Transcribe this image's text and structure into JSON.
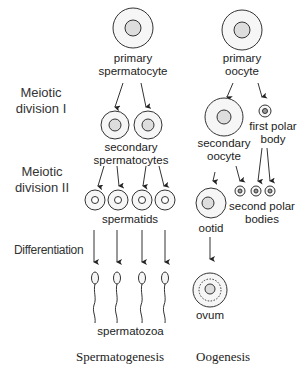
{
  "stages": {
    "meiosis1": [
      "Meiotic",
      "division I"
    ],
    "meiosis2": [
      "Meiotic",
      "division II"
    ],
    "differentiation": "Differentiation"
  },
  "spermatogenesis": {
    "primary": [
      "primary",
      "spermatocyte"
    ],
    "secondary": [
      "secondary",
      "spermatocytes"
    ],
    "spermatids": "spermatids",
    "spermatozoa": "spermatozoa"
  },
  "oogenesis": {
    "primary": [
      "primary",
      "oocyte"
    ],
    "secondary": [
      "secondary",
      "oocyte"
    ],
    "first_polar": [
      "first polar",
      "body"
    ],
    "ootid": "ootid",
    "second_polar": [
      "second polar",
      "bodies"
    ],
    "ovum": "ovum"
  },
  "captions": {
    "left": "Spermatogenesis",
    "right": "Oogenesis"
  }
}
